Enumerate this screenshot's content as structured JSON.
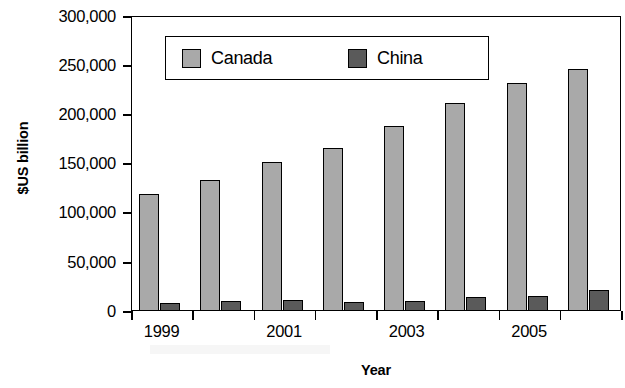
{
  "chart_data": {
    "type": "bar",
    "title": "",
    "subtitle": "",
    "xlabel": "Year",
    "ylabel": "$US billion",
    "categories": [
      "1999",
      "2000",
      "2001",
      "2002",
      "2003",
      "2004",
      "2005",
      "2006"
    ],
    "x_tick_labels": [
      "1999",
      "",
      "2001",
      "",
      "2003",
      "",
      "2005",
      ""
    ],
    "y_tick_labels": [
      "0",
      "50,000",
      "100,000",
      "150,000",
      "200,000",
      "250,000",
      "300,000"
    ],
    "y_tick_values": [
      0,
      50000,
      100000,
      150000,
      200000,
      250000,
      300000
    ],
    "ylim": [
      0,
      300000
    ],
    "grid": false,
    "legend_position": "upper-left-inside",
    "series": [
      {
        "name": "Canada",
        "color": "#a9a9a9",
        "values": [
          119000,
          133000,
          152000,
          166000,
          188000,
          212000,
          232000,
          246000
        ]
      },
      {
        "name": "China",
        "color": "#5a5a5a",
        "values": [
          8000,
          10000,
          11000,
          9500,
          10500,
          14500,
          15500,
          21500
        ]
      }
    ]
  },
  "legend": {
    "entries": [
      {
        "label": "Canada",
        "swatch": "#a9a9a9"
      },
      {
        "label": "China",
        "swatch": "#5a5a5a"
      }
    ]
  },
  "axes": {
    "y_title": "$US billion",
    "x_title": "Year"
  }
}
